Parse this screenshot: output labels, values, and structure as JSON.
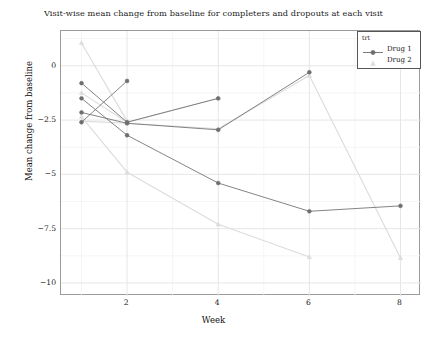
{
  "chart_data": {
    "type": "line",
    "title": "Visit-wise mean change from baseline for completers and dropouts at each visit",
    "xlabel": "Week",
    "ylabel": "Mean change from baseline",
    "xlim": [
      0.55,
      8.45
    ],
    "ylim": [
      -10.6,
      1.6
    ],
    "xticks": [
      2,
      4,
      6,
      8
    ],
    "xtick_labels": [
      "2",
      "4",
      "6",
      "8"
    ],
    "yticks": [
      0,
      -2.5,
      -5,
      -7.5,
      -10
    ],
    "ytick_labels": [
      "0",
      "−2.5",
      "−5",
      "−7.5",
      "−10"
    ],
    "grid": true,
    "grid_major_color": "#e6e6e6",
    "grid_minor_color": "#f3f3f3",
    "legend": {
      "title": "trt",
      "position": "top-right",
      "entries": [
        {
          "label": "Drug 1",
          "color": "#6e6e6e",
          "marker": "circle",
          "has_line": true
        },
        {
          "label": "Drug 2",
          "color": "#dcdcdc",
          "marker": "triangle",
          "has_line": false
        }
      ]
    },
    "colors": {
      "drug1": "#6e6e6e",
      "drug2": "#dcdcdc",
      "panel_border": "#9a9a9a",
      "text": "#1a1a1a"
    },
    "series": [
      {
        "name": "Drug 1 – dropouts at week 2",
        "trt": "Drug 1",
        "color": "#6e6e6e",
        "marker": "circle",
        "x": [
          1,
          2
        ],
        "values": [
          -2.6,
          -0.7
        ]
      },
      {
        "name": "Drug 1 – dropouts at week 4",
        "trt": "Drug 1",
        "color": "#6e6e6e",
        "marker": "circle",
        "x": [
          1,
          2,
          4
        ],
        "values": [
          -0.8,
          -2.6,
          -1.5
        ]
      },
      {
        "name": "Drug 1 – dropouts at week 6",
        "trt": "Drug 1",
        "color": "#6e6e6e",
        "marker": "circle",
        "x": [
          1,
          2,
          4,
          6
        ],
        "values": [
          -2.15,
          -2.65,
          -2.95,
          -0.3
        ]
      },
      {
        "name": "Drug 1 – completers",
        "trt": "Drug 1",
        "color": "#6e6e6e",
        "marker": "circle",
        "x": [
          1,
          2,
          4,
          6,
          8
        ],
        "values": [
          -1.5,
          -3.2,
          -5.4,
          -6.7,
          -6.45
        ]
      },
      {
        "name": "Drug 2 – dropouts at week 2",
        "trt": "Drug 2",
        "color": "#dcdcdc",
        "marker": "triangle",
        "x": [
          1,
          2
        ],
        "values": [
          1.05,
          -2.55
        ]
      },
      {
        "name": "Drug 2 – dropouts at week 4",
        "trt": "Drug 2",
        "color": "#dcdcdc",
        "marker": "triangle",
        "x": [
          1,
          2,
          4
        ],
        "values": [
          -1.25,
          -2.6,
          -1.5
        ]
      },
      {
        "name": "Drug 2 – dropouts at week 6",
        "trt": "Drug 2",
        "color": "#dcdcdc",
        "marker": "triangle",
        "x": [
          1,
          2,
          4,
          6
        ],
        "values": [
          -2.35,
          -4.9,
          -7.3,
          -8.8
        ]
      },
      {
        "name": "Drug 2 – completers",
        "trt": "Drug 2",
        "color": "#dcdcdc",
        "marker": "triangle",
        "x": [
          1,
          2,
          4,
          6,
          8
        ],
        "values": [
          -2.55,
          -2.65,
          -2.9,
          -0.45,
          -8.85
        ]
      }
    ]
  }
}
